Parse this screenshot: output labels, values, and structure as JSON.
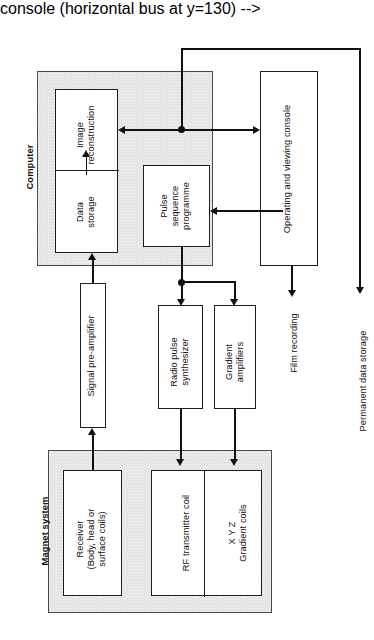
{
  "figure": {
    "orientation": "rotated-90-ccw",
    "colors": {
      "line": "#111111",
      "box_border": "#1d1d1d",
      "region_fill": "#e0e0e0",
      "background": "#ffffff"
    }
  },
  "regions": {
    "computer": {
      "label": "Computer"
    },
    "magnet_system": {
      "label": "Magnet system"
    }
  },
  "boxes": {
    "data_storage": {
      "label": "Data\nstorage",
      "line1": "Data",
      "line2": "storage"
    },
    "image_reconstruction": {
      "label": "Image\nreconstruction",
      "line1": "Image",
      "line2": "reconstruction"
    },
    "pulse_sequence_programme": {
      "line1": "Pulse",
      "line2": "sequence",
      "line3": "programme"
    },
    "operating_viewing_console": {
      "label": "Operating and viewing console"
    },
    "signal_pre_amplifier": {
      "label": "Signal pre-amplifier"
    },
    "radio_pulse_synthesizer": {
      "line1": "Radio pulse",
      "line2": "synthesizer"
    },
    "gradient_amplifiers": {
      "line1": "Gradient",
      "line2": "amplifiers"
    },
    "receiver": {
      "line1": "Receiver",
      "line2": "(Body, head or",
      "line3": "surface coils)"
    },
    "rf_transmitter_coil": {
      "label": "RF transmitter coil"
    },
    "xyz_gradient_coils": {
      "line1": "X Y Z",
      "line2": "Gradient coils"
    }
  },
  "endpoints": {
    "film_recording": {
      "label": "Film recording"
    },
    "permanent_data_storage": {
      "label": "Permanent data storage"
    }
  }
}
